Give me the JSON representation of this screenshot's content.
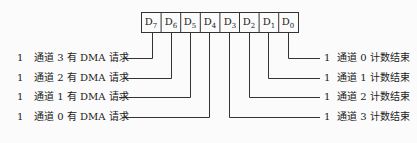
{
  "register": {
    "bits": [
      {
        "name": "D",
        "sub": "7"
      },
      {
        "name": "D",
        "sub": "6"
      },
      {
        "name": "D",
        "sub": "5"
      },
      {
        "name": "D",
        "sub": "4"
      },
      {
        "name": "D",
        "sub": "3"
      },
      {
        "name": "D",
        "sub": "2"
      },
      {
        "name": "D",
        "sub": "1"
      },
      {
        "name": "D",
        "sub": "0"
      }
    ]
  },
  "left_labels": [
    {
      "value": "1",
      "text": "通道 3 有 DMA 请求",
      "bit": "D7"
    },
    {
      "value": "1",
      "text": "通道 2 有 DMA 请求",
      "bit": "D6"
    },
    {
      "value": "1",
      "text": "通道 1 有 DMA 请求",
      "bit": "D5"
    },
    {
      "value": "1",
      "text": "通道 0 有 DMA 请求",
      "bit": "D4"
    }
  ],
  "right_labels": [
    {
      "value": "1",
      "text": "通道 0 计数结束",
      "bit": "D0"
    },
    {
      "value": "1",
      "text": "通道 1 计数结束",
      "bit": "D1"
    },
    {
      "value": "1",
      "text": "通道 2 计数结束",
      "bit": "D2"
    },
    {
      "value": "1",
      "text": "通道 3 计数结束",
      "bit": "D3"
    }
  ]
}
